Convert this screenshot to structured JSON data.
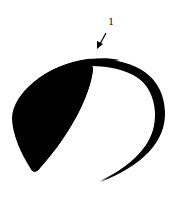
{
  "diagram": {
    "type": "stroke-order",
    "strokes": [
      {
        "number": "1",
        "label_position": {
          "x": 108,
          "y": 19
        },
        "arrow": {
          "from": [
            106,
            33
          ],
          "to": [
            98,
            48
          ]
        }
      }
    ],
    "colors": {
      "ink": "#000000",
      "background": "#ffffff",
      "label": "#222222"
    }
  }
}
